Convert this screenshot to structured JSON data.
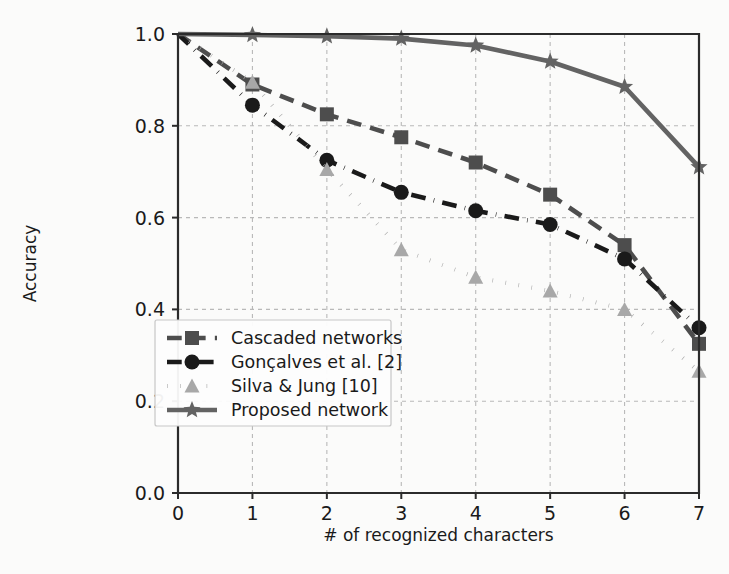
{
  "chart_data": {
    "type": "line",
    "title": "",
    "xlabel": "# of recognized characters",
    "ylabel": "Accuracy",
    "x": [
      0,
      1,
      2,
      3,
      4,
      5,
      6,
      7
    ],
    "xlim": [
      0,
      7
    ],
    "ylim": [
      0.0,
      1.0
    ],
    "xticks": [
      "0",
      "1",
      "2",
      "3",
      "4",
      "5",
      "6",
      "7"
    ],
    "yticks": [
      "0.0",
      "0.2",
      "0.4",
      "0.6",
      "0.8",
      "1.0"
    ],
    "grid": true,
    "legend_position": "lower left",
    "series": [
      {
        "name": "Cascaded networks",
        "values": [
          1.0,
          0.89,
          0.825,
          0.775,
          0.72,
          0.65,
          0.54,
          0.325
        ],
        "color": "#4d4d4d",
        "linestyle": "dashed",
        "marker": "square"
      },
      {
        "name": "Gonçalves et al. [2]",
        "values": [
          1.0,
          0.845,
          0.725,
          0.655,
          0.615,
          0.585,
          0.51,
          0.36
        ],
        "color": "#1a1a1a",
        "linestyle": "dashdot",
        "marker": "circle"
      },
      {
        "name": "Silva & Jung [10]",
        "values": [
          1.0,
          0.895,
          0.705,
          0.53,
          0.47,
          0.44,
          0.4,
          0.265
        ],
        "color": "#a8a8a8",
        "linestyle": "dotted",
        "marker": "triangle"
      },
      {
        "name": "Proposed network",
        "values": [
          1.0,
          0.998,
          0.995,
          0.99,
          0.975,
          0.94,
          0.885,
          0.71
        ],
        "color": "#636363",
        "linestyle": "solid",
        "marker": "star"
      }
    ]
  },
  "legend": {
    "entries": [
      "Cascaded networks",
      "Gonçalves et al. [2]",
      "Silva & Jung [10]",
      "Proposed network"
    ]
  },
  "axes": {
    "x_title": "# of recognized characters",
    "y_title": "Accuracy",
    "x_tick_labels": [
      "0",
      "1",
      "2",
      "3",
      "4",
      "5",
      "6",
      "7"
    ],
    "y_tick_labels": [
      "0.0",
      "0.2",
      "0.4",
      "0.6",
      "0.8",
      "1.0"
    ]
  },
  "colors": {
    "background": "#fbfbfa",
    "axis": "#2b2b2b",
    "grid": "#b9b9b9"
  }
}
